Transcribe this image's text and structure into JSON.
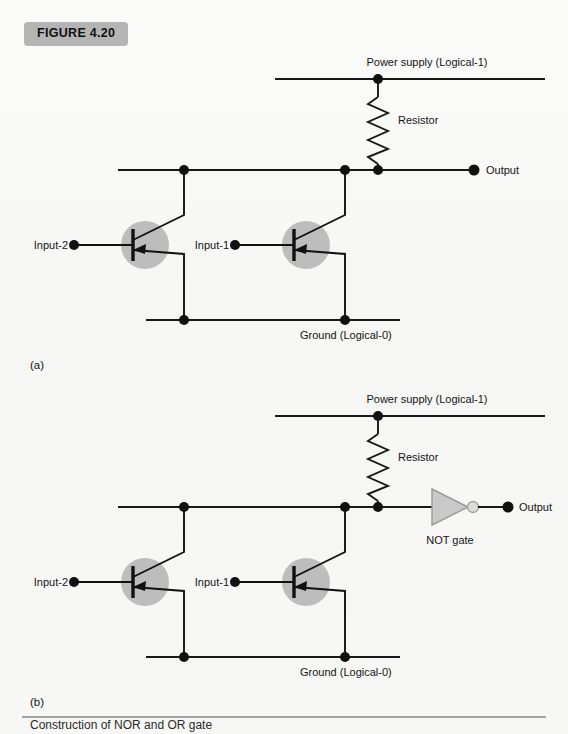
{
  "figure": {
    "badge_label": "FIGURE 4.20",
    "caption": "Construction of NOR and OR gate"
  },
  "colors": {
    "page_background": "#f7f7f6",
    "badge_background": "#b4b4b4",
    "wire": "#181818",
    "transistor_circle": "#bdbdbd",
    "gate_fill": "#c9c9c9",
    "gate_stroke": "#9a9a9a",
    "bubble_fill": "#dcdcdc"
  },
  "labels": {
    "power_supply": "Power supply (Logical-1)",
    "resistor": "Resistor",
    "output": "Output",
    "ground": "Ground (Logical-0)",
    "input_1": "Input-1",
    "input_2": "Input-2",
    "not_gate": "NOT gate",
    "part_a": "(a)",
    "part_b": "(b)"
  },
  "circuit_a": {
    "part_label": "(a)",
    "has_not_gate": false,
    "components": [
      {
        "name": "power-supply-rail",
        "type": "wire"
      },
      {
        "name": "resistor",
        "type": "resistor"
      },
      {
        "name": "output-rail",
        "type": "wire"
      },
      {
        "name": "transistor-input-2",
        "type": "transistor"
      },
      {
        "name": "transistor-input-1",
        "type": "transistor"
      },
      {
        "name": "ground-rail",
        "type": "wire"
      }
    ]
  },
  "circuit_b": {
    "part_label": "(b)",
    "has_not_gate": true,
    "components": [
      {
        "name": "power-supply-rail",
        "type": "wire"
      },
      {
        "name": "resistor",
        "type": "resistor"
      },
      {
        "name": "output-rail",
        "type": "wire"
      },
      {
        "name": "transistor-input-2",
        "type": "transistor"
      },
      {
        "name": "transistor-input-1",
        "type": "transistor"
      },
      {
        "name": "not-gate",
        "type": "inverter"
      },
      {
        "name": "ground-rail",
        "type": "wire"
      }
    ]
  }
}
